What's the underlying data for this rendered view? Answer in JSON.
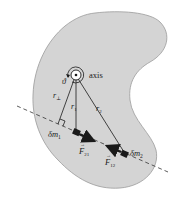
{
  "diagram": {
    "body_color": "#d4d4d4",
    "body_outline_color": "#9a9a9a",
    "line_color": "#1a1a1a",
    "labels": {
      "axis": "axis",
      "angle": "ϑ",
      "r_perp": "r",
      "r_perp_sub": "⊥",
      "r1": "r",
      "r1_sub": "1",
      "r2": "r",
      "r2_sub": "2",
      "dm1": "δm",
      "dm1_sub": "1",
      "dm2": "δm",
      "dm2_sub": "2",
      "F21": "F",
      "F21_sub": "21",
      "F12": "F",
      "F12_sub": "12",
      "vector_arrow": "→"
    }
  }
}
